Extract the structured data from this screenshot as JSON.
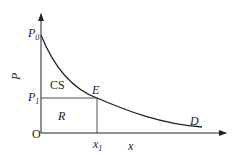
{
  "diagram": {
    "axes": {
      "y_label": "P",
      "x_label": "x",
      "origin_label": "O"
    },
    "labels": {
      "p0": {
        "main": "P",
        "sub": "0"
      },
      "p1": {
        "main": "P",
        "sub": "1"
      },
      "x1": {
        "main": "x",
        "sub": "1"
      },
      "equilibrium": "E",
      "demand": "D",
      "consumer_surplus": "CS",
      "revenue": "R"
    },
    "colors": {
      "line": "#222222",
      "background": "#ffffff"
    }
  }
}
